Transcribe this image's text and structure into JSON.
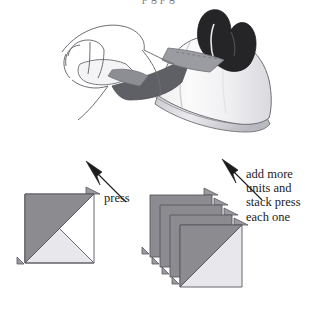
{
  "page": {
    "clipped_header_text": "p      g  p        g",
    "background_color": "#ffffff"
  },
  "illustration": {
    "name": "hand-pressing-fabric-with-iron",
    "description": "A hand holding a pieced fabric unit while an iron presses the seam",
    "colors": {
      "outline": "#6e6e74",
      "iron_body_light": "#f2f2f4",
      "iron_body_shade": "#d8d8dd",
      "iron_handle_dark": "#2b2b2b",
      "fabric_dark": "#6e6e74",
      "fabric_mid": "#9a9aa0",
      "fabric_light": "#e6e6ea"
    }
  },
  "diagrams": {
    "single_unit": {
      "name": "half-square-triangle-unit",
      "dark_triangle_color": "#8b8b90",
      "light_triangle_color": "#e8e8ec",
      "outline_color": "#58585e",
      "dog_ear_color": "#9a9aa0"
    },
    "stack": {
      "name": "stacked-half-square-triangle-units",
      "unit_count": 4,
      "offset_px": 10,
      "dark_triangle_color": "#8b8b90",
      "light_triangle_color": "#e8e8ec",
      "outline_color": "#58585e"
    }
  },
  "arrows": {
    "press_arrow": {
      "name": "press-direction-arrow",
      "direction": "up-left",
      "color": "#1c1c1c"
    },
    "stack_arrow": {
      "name": "stack-direction-arrow",
      "direction": "up-left",
      "color": "#1c1c1c"
    }
  },
  "labels": {
    "press": "press",
    "stack_instruction": [
      "add more",
      "units and",
      "stack press",
      "each one"
    ]
  }
}
